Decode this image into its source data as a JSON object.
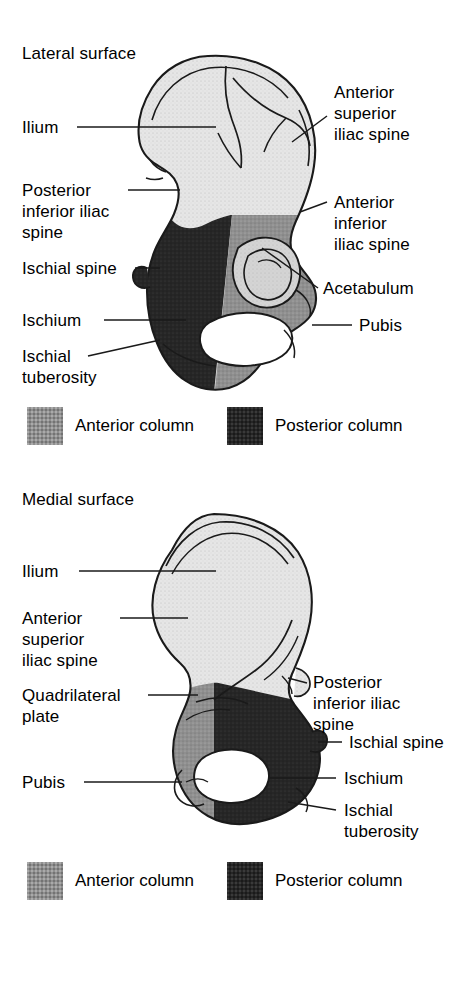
{
  "document": {
    "kind": "anatomy-illustration",
    "subject": "Innominate bone (hip bone) showing anterior and posterior acetabular columns"
  },
  "colors": {
    "anterior_column": "#8f8f8f",
    "posterior_column": "#262626",
    "bone_light": "#e3e3e3",
    "acetabulum_light": "#d2d2d2",
    "outline": "#1a1a1a",
    "foramen": "#ffffff",
    "background": "#ffffff",
    "text": "#000000"
  },
  "panels": [
    {
      "id": "lateral",
      "title": "Lateral surface",
      "labels_left": [
        {
          "name": "ilium",
          "text": "Ilium"
        },
        {
          "name": "posterior-inferior-iliac-spine",
          "text": "Posterior\ninferior iliac\nspine"
        },
        {
          "name": "ischial-spine",
          "text": "Ischial spine"
        },
        {
          "name": "ischium",
          "text": "Ischium"
        },
        {
          "name": "ischial-tuberosity",
          "text": "Ischial\ntuberosity"
        }
      ],
      "labels_right": [
        {
          "name": "anterior-superior-iliac-spine",
          "text": "Anterior\nsuperior\niliac spine"
        },
        {
          "name": "anterior-inferior-iliac-spine",
          "text": "Anterior\ninferior\niliac spine"
        },
        {
          "name": "acetabulum",
          "text": "Acetabulum"
        },
        {
          "name": "pubis",
          "text": "Pubis"
        }
      ],
      "legend": [
        {
          "name": "anterior-column",
          "text": "Anterior column",
          "swatch": "anterior"
        },
        {
          "name": "posterior-column",
          "text": "Posterior column",
          "swatch": "posterior"
        }
      ]
    },
    {
      "id": "medial",
      "title": "Medial surface",
      "labels_left": [
        {
          "name": "ilium",
          "text": "Ilium"
        },
        {
          "name": "anterior-superior-iliac-spine",
          "text": "Anterior\nsuperior\niliac spine"
        },
        {
          "name": "quadrilateral-plate",
          "text": "Quadrilateral\nplate"
        },
        {
          "name": "pubis",
          "text": "Pubis"
        }
      ],
      "labels_right": [
        {
          "name": "posterior-inferior-iliac-spine",
          "text": "Posterior\ninferior iliac\nspine"
        },
        {
          "name": "ischial-spine",
          "text": "Ischial spine"
        },
        {
          "name": "ischium",
          "text": "Ischium"
        },
        {
          "name": "ischial-tuberosity",
          "text": "Ischial\ntuberosity"
        }
      ],
      "legend": [
        {
          "name": "anterior-column",
          "text": "Anterior column",
          "swatch": "anterior"
        },
        {
          "name": "posterior-column",
          "text": "Posterior column",
          "swatch": "posterior"
        }
      ]
    }
  ]
}
